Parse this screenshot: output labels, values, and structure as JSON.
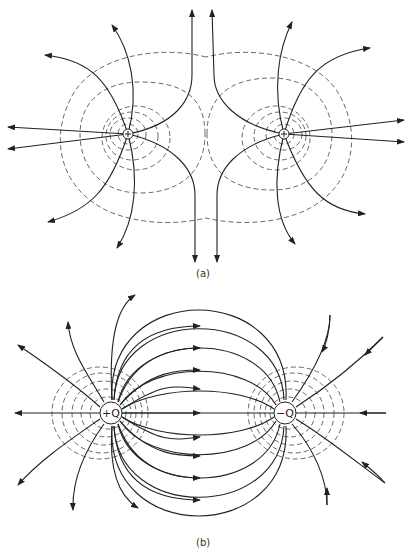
{
  "figure_a": {
    "caption": "(a)",
    "description": "Electric field lines and equipotentials of two equal positive charges",
    "charges": [
      {
        "label": "+",
        "x": 128,
        "y": 134
      },
      {
        "label": "+",
        "x": 284,
        "y": 134
      }
    ]
  },
  "figure_b": {
    "caption": "(b)",
    "description": "Electric field lines and equipotentials of an electric dipole",
    "charges": [
      {
        "label": "+Q",
        "x": 111,
        "y": 413
      },
      {
        "label": "−Q",
        "x": 285,
        "y": 413
      }
    ]
  },
  "colors": {
    "line": "#222222",
    "equipotential": "#444444",
    "background": "#ffffff"
  }
}
